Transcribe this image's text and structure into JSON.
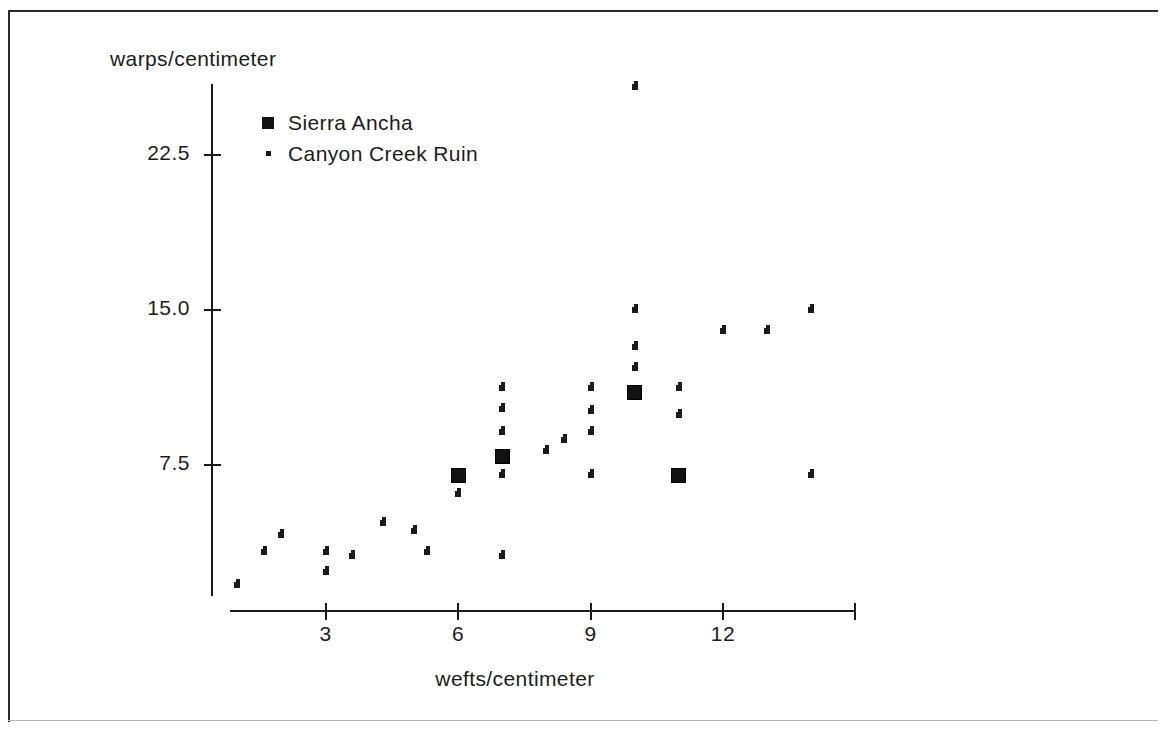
{
  "chart_data": {
    "type": "scatter",
    "title": "",
    "xlabel": "wefts/centimeter",
    "ylabel": "warps/centimeter",
    "xticks": [
      "3",
      "6",
      "9",
      "12"
    ],
    "xtick_values": [
      3,
      6,
      9,
      12
    ],
    "yticks": [
      "22.5",
      "15.0",
      "7.5"
    ],
    "ytick_values": [
      22.5,
      15.0,
      7.5
    ],
    "xlim": [
      0,
      14.2
    ],
    "ylim": [
      0,
      26
    ],
    "grid": false,
    "legend_position": "upper-left-inside",
    "series": [
      {
        "name": "Sierra Ancha",
        "marker": "filled-square",
        "color": "#111111",
        "points": [
          {
            "x": 6.0,
            "y": 7.0
          },
          {
            "x": 7.0,
            "y": 7.9
          },
          {
            "x": 10.0,
            "y": 11.0
          },
          {
            "x": 11.0,
            "y": 7.0
          }
        ]
      },
      {
        "name": "Canyon Creek Ruin",
        "marker": "small-dot",
        "color": "#1a1a1a",
        "points": [
          {
            "x": 1.0,
            "y": 1.7
          },
          {
            "x": 1.6,
            "y": 3.3
          },
          {
            "x": 2.0,
            "y": 4.1
          },
          {
            "x": 3.0,
            "y": 3.3
          },
          {
            "x": 3.0,
            "y": 2.3
          },
          {
            "x": 3.6,
            "y": 3.1
          },
          {
            "x": 4.3,
            "y": 4.7
          },
          {
            "x": 5.0,
            "y": 4.3
          },
          {
            "x": 5.3,
            "y": 3.3
          },
          {
            "x": 6.0,
            "y": 6.1
          },
          {
            "x": 7.0,
            "y": 11.2
          },
          {
            "x": 7.0,
            "y": 10.2
          },
          {
            "x": 7.0,
            "y": 9.1
          },
          {
            "x": 7.0,
            "y": 7.0
          },
          {
            "x": 7.0,
            "y": 3.1
          },
          {
            "x": 8.0,
            "y": 8.2
          },
          {
            "x": 8.4,
            "y": 8.7
          },
          {
            "x": 9.0,
            "y": 11.2
          },
          {
            "x": 9.0,
            "y": 10.1
          },
          {
            "x": 9.0,
            "y": 9.1
          },
          {
            "x": 9.0,
            "y": 7.0
          },
          {
            "x": 10.0,
            "y": 13.2
          },
          {
            "x": 10.0,
            "y": 12.2
          },
          {
            "x": 10.0,
            "y": 15.0
          },
          {
            "x": 10.0,
            "y": 25.8
          },
          {
            "x": 11.0,
            "y": 11.2
          },
          {
            "x": 11.0,
            "y": 9.9
          },
          {
            "x": 12.0,
            "y": 14.0
          },
          {
            "x": 13.0,
            "y": 14.0
          },
          {
            "x": 14.0,
            "y": 15.0
          },
          {
            "x": 14.0,
            "y": 7.0
          }
        ]
      }
    ]
  },
  "legend": {
    "entries": [
      {
        "label": "Sierra Ancha",
        "marker": "filled-square"
      },
      {
        "label": "Canyon Creek Ruin",
        "marker": "small-dot"
      }
    ]
  },
  "figure": {
    "background": "#ffffff",
    "ink": "#1a1a1a"
  }
}
